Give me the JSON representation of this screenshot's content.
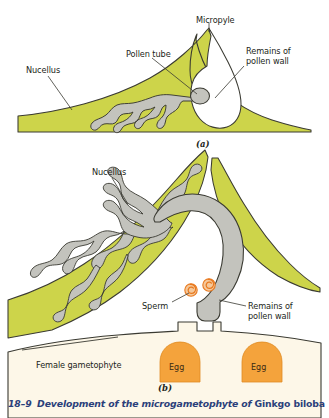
{
  "figure": {
    "caption_number": "18–9",
    "caption_body": "Development of the microgametophyte of ",
    "caption_species": "Ginkgo biloba",
    "panel_a_mark": "(a)",
    "panel_b_mark": "(b)"
  },
  "colors": {
    "nucellus": "#cdd44a",
    "nucellus_edge": "#3a3a32",
    "pollen_tube": "#c3c3bd",
    "pollen_tube_edge": "#3a3a32",
    "egg": "#f4a33c",
    "egg_edge": "#e08c23",
    "gametophyte": "#fdf7e8",
    "gametophyte_edge": "#3a3a32",
    "sperm": "#e8791f",
    "label_text": "#231f20",
    "caption_text": "#2b3f7a",
    "background": "#ffffff"
  },
  "panel_a": {
    "labels": [
      {
        "id": "micropyle",
        "text": "Micropyle",
        "x": 196,
        "y": 16
      },
      {
        "id": "pollen-tube",
        "text": "Pollen tube",
        "x": 126,
        "y": 50
      },
      {
        "id": "nucellus",
        "text": "Nucellus",
        "x": 26,
        "y": 66
      },
      {
        "id": "remains-wall-1",
        "text": "Remains of",
        "x": 246,
        "y": 47
      },
      {
        "id": "remains-wall-2",
        "text": "pollen wall",
        "x": 246,
        "y": 57
      }
    ]
  },
  "panel_b": {
    "labels": [
      {
        "id": "nucellus-b",
        "text": "Nucellus",
        "x": 92,
        "y": 168
      },
      {
        "id": "sperm",
        "text": "Sperm",
        "x": 142,
        "y": 302
      },
      {
        "id": "remains-wall-b1",
        "text": "Remains of",
        "x": 248,
        "y": 302
      },
      {
        "id": "remains-wall-b2",
        "text": "pollen wall",
        "x": 248,
        "y": 312
      },
      {
        "id": "female-gam",
        "text": "Female gametophyte",
        "x": 36,
        "y": 361
      }
    ],
    "eggs": [
      {
        "id": "egg-left",
        "label": "Egg",
        "cx": 180,
        "cy": 368
      },
      {
        "id": "egg-right",
        "label": "Egg",
        "cx": 262,
        "cy": 368
      }
    ],
    "sperm_count": 2
  }
}
